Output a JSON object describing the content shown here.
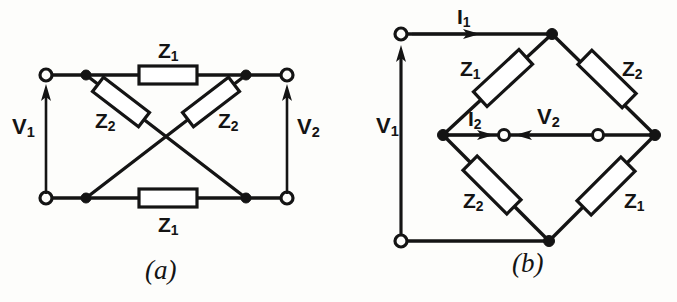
{
  "figure": {
    "kind": "lattice-network-schematic",
    "ink_color": "#141414",
    "background_color": "#fdfdfb",
    "panels": [
      {
        "id": "a",
        "caption": "(a)",
        "description": "Lattice (symmetric bridge) network drawn in flat form",
        "port_labels": [
          {
            "name": "v1",
            "text": "V",
            "sub": "1"
          },
          {
            "name": "v2",
            "text": "V",
            "sub": "2"
          }
        ],
        "impedance_labels": [
          {
            "name": "z1-top",
            "text": "Z",
            "sub": "1"
          },
          {
            "name": "z2-left",
            "text": "Z",
            "sub": "2"
          },
          {
            "name": "z2-right",
            "text": "Z",
            "sub": "2"
          },
          {
            "name": "z1-bottom",
            "text": "Z",
            "sub": "1"
          }
        ]
      },
      {
        "id": "b",
        "caption": "(b)",
        "description": "Same lattice network redrawn in bridge (diamond) form",
        "port_labels": [
          {
            "name": "v1",
            "text": "V",
            "sub": "1"
          },
          {
            "name": "v2",
            "text": "V",
            "sub": "2"
          }
        ],
        "current_labels": [
          {
            "name": "i1",
            "text": "I",
            "sub": "1"
          },
          {
            "name": "i2",
            "text": "I",
            "sub": "2"
          }
        ],
        "impedance_labels": [
          {
            "name": "z1-upper-left",
            "text": "Z",
            "sub": "1"
          },
          {
            "name": "z2-upper-right",
            "text": "Z",
            "sub": "2"
          },
          {
            "name": "z2-lower-left",
            "text": "Z",
            "sub": "2"
          },
          {
            "name": "z1-lower-right",
            "text": "Z",
            "sub": "1"
          }
        ]
      }
    ]
  },
  "panel_a": {
    "caption": "(a)",
    "z1_top": {
      "text": "Z",
      "sub": "1"
    },
    "z2_left": {
      "text": "Z",
      "sub": "2"
    },
    "z2_right": {
      "text": "Z",
      "sub": "2"
    },
    "z1_bottom": {
      "text": "Z",
      "sub": "1"
    },
    "v1": {
      "text": "V",
      "sub": "1"
    },
    "v2": {
      "text": "V",
      "sub": "2"
    }
  },
  "panel_b": {
    "caption": "(b)",
    "i1": {
      "text": "I",
      "sub": "1"
    },
    "i2": {
      "text": "I",
      "sub": "2"
    },
    "v1": {
      "text": "V",
      "sub": "1"
    },
    "v2": {
      "text": "V",
      "sub": "2"
    },
    "z1_upper_left": {
      "text": "Z",
      "sub": "1"
    },
    "z2_upper_right": {
      "text": "Z",
      "sub": "2"
    },
    "z2_lower_left": {
      "text": "Z",
      "sub": "2"
    },
    "z1_lower_right": {
      "text": "Z",
      "sub": "1"
    }
  }
}
